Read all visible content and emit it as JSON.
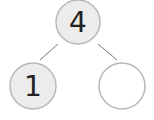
{
  "diagram": {
    "type": "number-bond",
    "whole": {
      "value": "4",
      "fill": "#ececec"
    },
    "parts": [
      {
        "value": "1",
        "fill": "#ececec"
      },
      {
        "value": "",
        "fill": "#ffffff"
      }
    ],
    "stroke_color": "#b8b8b8",
    "line_color": "#777777"
  }
}
